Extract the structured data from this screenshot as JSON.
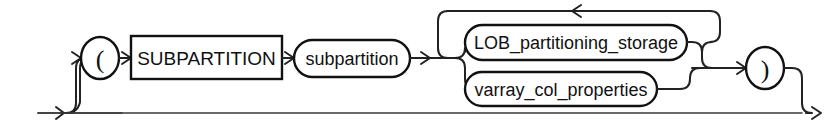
{
  "diagram": {
    "kind": "railroad-syntax-diagram",
    "name": "subpartition_by_list_subpartition_spec",
    "background_color": "#ffffff",
    "line_color": "#222222",
    "text_color": "#111111",
    "entry": {
      "label": "",
      "icon": "entry-arrow-icon"
    },
    "nodes": [
      {
        "id": "open-paren",
        "type": "terminal-circle",
        "label": "(",
        "cx": 100,
        "cy": 58,
        "rx": 19,
        "ry": 21
      },
      {
        "id": "subpartition-keyword",
        "type": "terminal-rect",
        "label": "SUBPARTITION",
        "x": 131,
        "y": 36,
        "width": 151,
        "height": 43
      },
      {
        "id": "subpartition-name",
        "type": "nonterminal-stadium",
        "label": "subpartition",
        "x": 294,
        "y": 40,
        "width": 116,
        "height": 37
      },
      {
        "id": "lob-partitioning-storage",
        "type": "nonterminal-stadium",
        "label": "LOB_partitioning_storage",
        "x": 465,
        "y": 25,
        "width": 222,
        "height": 35
      },
      {
        "id": "varray-col-properties",
        "type": "nonterminal-stadium",
        "label": "varray_col_properties",
        "x": 465,
        "y": 72,
        "width": 192,
        "height": 34
      },
      {
        "id": "close-paren",
        "type": "terminal-circle",
        "label": ")",
        "cx": 765,
        "cy": 68,
        "rx": 19,
        "ry": 21
      }
    ],
    "loop": {
      "id": "repeat-loop",
      "description": "loop back over alternatives",
      "arrow_direction": "left",
      "top_y": 11
    },
    "exit": {
      "label": "",
      "icon": "exit-arrow-icon"
    }
  }
}
